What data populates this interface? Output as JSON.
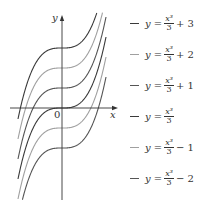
{
  "chart_data": {
    "type": "line",
    "title": "",
    "xlabel": "x",
    "ylabel": "y",
    "origin_label": "0",
    "xlim": [
      -2.2,
      2.2
    ],
    "ylim": [
      -4.6,
      4.6
    ],
    "grid": false,
    "legend_position": "right",
    "series": [
      {
        "name": "y = x^3/3 + 3",
        "c": 3,
        "color": "#3a3a3a",
        "label_prefix": "y =",
        "label_num": "x³",
        "label_den": "3",
        "label_suffix": "+ 3"
      },
      {
        "name": "y = x^3/3 + 2",
        "c": 2,
        "color": "#a0a0a0",
        "label_prefix": "y =",
        "label_num": "x³",
        "label_den": "3",
        "label_suffix": "+ 2"
      },
      {
        "name": "y = x^3/3 + 1",
        "c": 1,
        "color": "#555555",
        "label_prefix": "y =",
        "label_num": "x³",
        "label_den": "3",
        "label_suffix": "+ 1"
      },
      {
        "name": "y = x^3/3",
        "c": 0,
        "color": "#3a3a3a",
        "label_prefix": "y =",
        "label_num": "x³",
        "label_den": "3",
        "label_suffix": ""
      },
      {
        "name": "y = x^3/3 - 1",
        "c": -1,
        "color": "#a0a0a0",
        "label_prefix": "y =",
        "label_num": "x³",
        "label_den": "3",
        "label_suffix": "− 1"
      },
      {
        "name": "y = x^3/3 - 2",
        "c": -2,
        "color": "#555555",
        "label_prefix": "y =",
        "label_num": "x³",
        "label_den": "3",
        "label_suffix": "− 2"
      }
    ]
  }
}
